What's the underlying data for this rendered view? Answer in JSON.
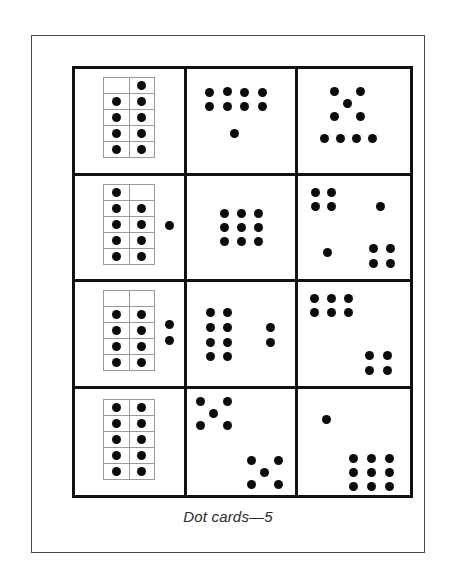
{
  "page": {
    "background_color": "#ffffff",
    "frame_color": "#4a4a4a",
    "grid_color": "#111111",
    "dot_color": "#0b0b0b",
    "tenframe_color": "#9a9a9a"
  },
  "caption": {
    "text": "Dot cards—5"
  },
  "grid": {
    "rows": 4,
    "columns": 3
  },
  "cards": [
    {
      "id": "card-r1c1",
      "row": 1,
      "column": 1,
      "total_dots": 9,
      "ten_frame": {
        "x": 28,
        "y": 8,
        "width": 52,
        "height": 81,
        "columns": 2,
        "rows": 5,
        "filled": [
          false,
          true,
          true,
          true,
          true,
          true,
          true,
          true,
          true,
          true
        ]
      },
      "loose_dots": []
    },
    {
      "id": "card-r1c2",
      "row": 1,
      "column": 2,
      "total_dots": 9,
      "ten_frame": null,
      "loose_dots": [
        {
          "x": 23,
          "y": 23
        },
        {
          "x": 41,
          "y": 22
        },
        {
          "x": 58,
          "y": 23
        },
        {
          "x": 76,
          "y": 23
        },
        {
          "x": 23,
          "y": 37
        },
        {
          "x": 41,
          "y": 37
        },
        {
          "x": 58,
          "y": 37
        },
        {
          "x": 76,
          "y": 37
        },
        {
          "x": 48,
          "y": 64
        }
      ]
    },
    {
      "id": "card-r1c3",
      "row": 1,
      "column": 3,
      "total_dots": 9,
      "ten_frame": null,
      "loose_dots": [
        {
          "x": 36,
          "y": 22
        },
        {
          "x": 62,
          "y": 22
        },
        {
          "x": 49,
          "y": 34
        },
        {
          "x": 36,
          "y": 47
        },
        {
          "x": 62,
          "y": 47
        },
        {
          "x": 26,
          "y": 69
        },
        {
          "x": 42,
          "y": 69
        },
        {
          "x": 58,
          "y": 69
        },
        {
          "x": 74,
          "y": 69
        }
      ]
    },
    {
      "id": "card-r2c1",
      "row": 2,
      "column": 1,
      "total_dots": 10,
      "ten_frame": {
        "x": 28,
        "y": 8,
        "width": 52,
        "height": 81,
        "columns": 2,
        "rows": 5,
        "filled": [
          true,
          false,
          true,
          true,
          true,
          true,
          true,
          true,
          true,
          true
        ]
      },
      "loose_dots": [
        {
          "x": 94,
          "y": 50
        }
      ]
    },
    {
      "id": "card-r2c2",
      "row": 2,
      "column": 2,
      "total_dots": 9,
      "ten_frame": null,
      "loose_dots": [
        {
          "x": 38,
          "y": 38
        },
        {
          "x": 55,
          "y": 38
        },
        {
          "x": 72,
          "y": 38
        },
        {
          "x": 38,
          "y": 52
        },
        {
          "x": 55,
          "y": 52
        },
        {
          "x": 72,
          "y": 52
        },
        {
          "x": 38,
          "y": 66
        },
        {
          "x": 55,
          "y": 66
        },
        {
          "x": 72,
          "y": 66
        }
      ]
    },
    {
      "id": "card-r2c3",
      "row": 2,
      "column": 3,
      "total_dots": 10,
      "ten_frame": null,
      "loose_dots": [
        {
          "x": 17,
          "y": 17
        },
        {
          "x": 33,
          "y": 17
        },
        {
          "x": 17,
          "y": 31
        },
        {
          "x": 33,
          "y": 31
        },
        {
          "x": 82,
          "y": 31
        },
        {
          "x": 29,
          "y": 77
        },
        {
          "x": 75,
          "y": 73
        },
        {
          "x": 92,
          "y": 73
        },
        {
          "x": 75,
          "y": 88
        },
        {
          "x": 92,
          "y": 88
        }
      ]
    },
    {
      "id": "card-r3c1",
      "row": 3,
      "column": 1,
      "total_dots": 10,
      "ten_frame": {
        "x": 28,
        "y": 8,
        "width": 52,
        "height": 81,
        "columns": 2,
        "rows": 5,
        "filled": [
          false,
          false,
          true,
          true,
          true,
          true,
          true,
          true,
          true,
          true
        ]
      },
      "loose_dots": [
        {
          "x": 94,
          "y": 42
        },
        {
          "x": 94,
          "y": 58
        }
      ]
    },
    {
      "id": "card-r3c2",
      "row": 3,
      "column": 2,
      "total_dots": 10,
      "ten_frame": null,
      "loose_dots": [
        {
          "x": 24,
          "y": 30
        },
        {
          "x": 41,
          "y": 30
        },
        {
          "x": 24,
          "y": 45
        },
        {
          "x": 41,
          "y": 45
        },
        {
          "x": 24,
          "y": 60
        },
        {
          "x": 41,
          "y": 60
        },
        {
          "x": 24,
          "y": 74
        },
        {
          "x": 41,
          "y": 74
        },
        {
          "x": 84,
          "y": 45
        },
        {
          "x": 84,
          "y": 60
        }
      ]
    },
    {
      "id": "card-r3c3",
      "row": 3,
      "column": 3,
      "total_dots": 10,
      "ten_frame": null,
      "loose_dots": [
        {
          "x": 16,
          "y": 16
        },
        {
          "x": 33,
          "y": 16
        },
        {
          "x": 50,
          "y": 16
        },
        {
          "x": 16,
          "y": 30
        },
        {
          "x": 33,
          "y": 30
        },
        {
          "x": 50,
          "y": 30
        },
        {
          "x": 71,
          "y": 73
        },
        {
          "x": 89,
          "y": 73
        },
        {
          "x": 71,
          "y": 88
        },
        {
          "x": 89,
          "y": 88
        }
      ]
    },
    {
      "id": "card-r4c1",
      "row": 4,
      "column": 1,
      "total_dots": 10,
      "ten_frame": {
        "x": 28,
        "y": 10,
        "width": 52,
        "height": 81,
        "columns": 2,
        "rows": 5,
        "filled": [
          true,
          true,
          true,
          true,
          true,
          true,
          true,
          true,
          true,
          true
        ]
      },
      "loose_dots": []
    },
    {
      "id": "card-r4c2",
      "row": 4,
      "column": 2,
      "total_dots": 10,
      "ten_frame": null,
      "loose_dots": [
        {
          "x": 14,
          "y": 13
        },
        {
          "x": 41,
          "y": 13
        },
        {
          "x": 27,
          "y": 25
        },
        {
          "x": 14,
          "y": 37
        },
        {
          "x": 41,
          "y": 37
        },
        {
          "x": 65,
          "y": 72
        },
        {
          "x": 92,
          "y": 72
        },
        {
          "x": 78,
          "y": 84
        },
        {
          "x": 65,
          "y": 96
        },
        {
          "x": 92,
          "y": 96
        }
      ]
    },
    {
      "id": "card-r4c3",
      "row": 4,
      "column": 3,
      "total_dots": 10,
      "ten_frame": null,
      "loose_dots": [
        {
          "x": 28,
          "y": 31
        },
        {
          "x": 55,
          "y": 70
        },
        {
          "x": 73,
          "y": 70
        },
        {
          "x": 91,
          "y": 70
        },
        {
          "x": 55,
          "y": 84
        },
        {
          "x": 73,
          "y": 84
        },
        {
          "x": 91,
          "y": 84
        },
        {
          "x": 55,
          "y": 98
        },
        {
          "x": 73,
          "y": 98
        },
        {
          "x": 91,
          "y": 98
        }
      ]
    }
  ]
}
